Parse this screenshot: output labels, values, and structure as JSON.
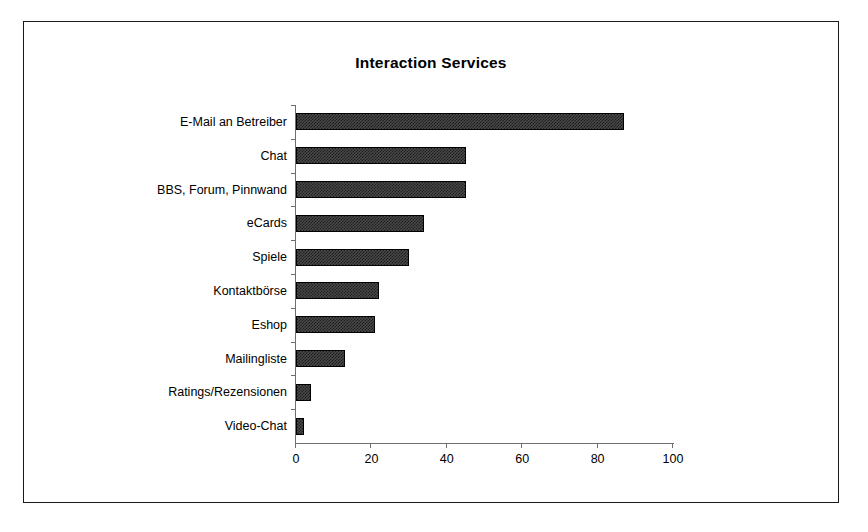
{
  "chart_data": {
    "type": "bar",
    "orientation": "horizontal",
    "title": "Interaction Services",
    "xlabel": "",
    "ylabel": "",
    "categories": [
      "E-Mail an Betreiber",
      "Chat",
      "BBS, Forum, Pinnwand",
      "eCards",
      "Spiele",
      "Kontaktbörse",
      "Eshop",
      "Mailingliste",
      "Ratings/Rezensionen",
      "Video-Chat"
    ],
    "values": [
      87,
      45,
      45,
      34,
      30,
      22,
      21,
      13,
      4,
      2
    ],
    "xlim": [
      0,
      100
    ],
    "xticks": [
      0,
      20,
      40,
      60,
      80,
      100
    ],
    "xtick_labels": [
      "0",
      "20",
      "40",
      "60",
      "80",
      "100"
    ],
    "grid": false,
    "legend": false,
    "bar_color": "#3a3a3a",
    "bar_border_color": "#000000",
    "axis_color": "#6e6e6e",
    "frame_color": "#1a1a1a"
  }
}
